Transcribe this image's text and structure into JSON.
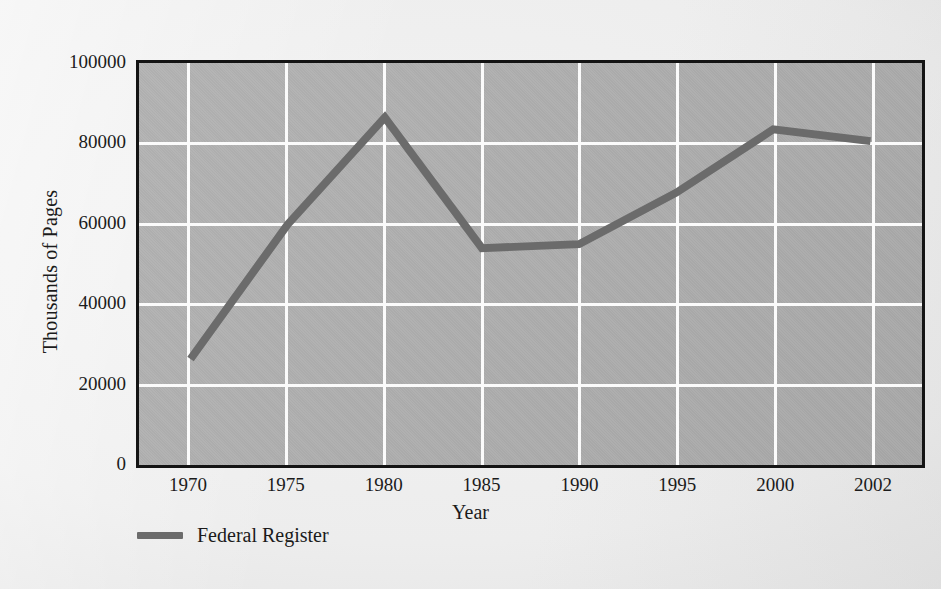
{
  "chart_data": {
    "type": "line",
    "title": "",
    "xlabel": "Year",
    "ylabel": "Thousands of Pages",
    "categories": [
      "1970",
      "1975",
      "1980",
      "1985",
      "1990",
      "1995",
      "2000",
      "2002"
    ],
    "series": [
      {
        "name": "Federal Register",
        "color": "#6b6b6b",
        "values": [
          26000,
          60000,
          87000,
          54000,
          55000,
          68000,
          84000,
          81000
        ]
      }
    ],
    "ylim": [
      0,
      100000
    ],
    "yticks": [
      0,
      20000,
      40000,
      60000,
      80000,
      100000
    ],
    "ytick_labels": [
      "0",
      "20000",
      "40000",
      "60000",
      "80000",
      "100000"
    ],
    "xtick_labels": [
      "1970",
      "1975",
      "1980",
      "1985",
      "1990",
      "1995",
      "2000",
      "2002"
    ],
    "grid": true,
    "grid_color": "#fbfbfb",
    "plot_background": "#adadad",
    "page_background": "#eeeeee",
    "axis_color": "#141414",
    "legend_position": "below-left",
    "legend_entries": [
      {
        "label": "Federal Register",
        "color": "#6b6b6b"
      }
    ]
  },
  "axes": {
    "y_title": "Thousands of Pages",
    "x_title": "Year"
  },
  "legend": {
    "entry_label": "Federal Register",
    "swatch_name": "line-swatch"
  }
}
